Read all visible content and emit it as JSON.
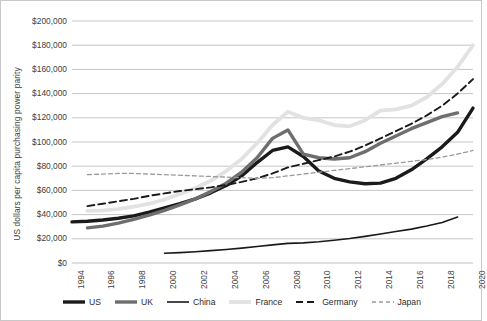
{
  "chart_data": {
    "type": "line",
    "title": "",
    "xlabel": "",
    "ylabel": "US dollars per capita purchasing power parity",
    "xlim": [
      1994,
      2020
    ],
    "ylim": [
      0,
      200000
    ],
    "grid": true,
    "legend_position": "bottom",
    "ytick_labels": [
      "$200,000",
      "$180,000",
      "$160,000",
      "$140,000",
      "$120,000",
      "$100,000",
      "$80,000",
      "$60,000",
      "$40,000",
      "$20,000",
      "$0"
    ],
    "ytick_values": [
      200000,
      180000,
      160000,
      140000,
      120000,
      100000,
      80000,
      60000,
      40000,
      20000,
      0
    ],
    "xtick_labels": [
      "1994",
      "1996",
      "1998",
      "2000",
      "2002",
      "2004",
      "2006",
      "2008",
      "2010",
      "2012",
      "2014",
      "2016",
      "2018",
      "2020"
    ],
    "xtick_values": [
      1994,
      1996,
      1998,
      2000,
      2002,
      2004,
      2006,
      2008,
      2010,
      2012,
      2014,
      2016,
      2018,
      2020
    ],
    "series": [
      {
        "name": "US",
        "color": "#1a1a1a",
        "width": 3.4,
        "dash": "none",
        "x": [
          1994,
          1995,
          1996,
          1997,
          1998,
          1999,
          2000,
          2001,
          2002,
          2003,
          2004,
          2005,
          2006,
          2007,
          2008,
          2009,
          2010,
          2011,
          2012,
          2013,
          2014,
          2015,
          2016,
          2017,
          2018,
          2019,
          2020
        ],
        "values": [
          34000,
          34500,
          35500,
          37000,
          39000,
          42000,
          45500,
          49000,
          53000,
          58000,
          64000,
          72000,
          83000,
          93000,
          96000,
          88000,
          76000,
          70000,
          67000,
          65500,
          66000,
          70000,
          77000,
          86000,
          96000,
          108000,
          128000
        ]
      },
      {
        "name": "UK",
        "color": "#6e6e6e",
        "width": 3.4,
        "dash": "none",
        "x": [
          1995,
          1996,
          1997,
          1998,
          1999,
          2000,
          2001,
          2002,
          2003,
          2004,
          2005,
          2006,
          2007,
          2008,
          2009,
          2010,
          2011,
          2012,
          2013,
          2014,
          2015,
          2016,
          2017,
          2018,
          2019
        ],
        "values": [
          29000,
          30500,
          33000,
          36000,
          39500,
          43500,
          48000,
          53000,
          59000,
          66000,
          75000,
          87000,
          103000,
          110000,
          90000,
          87000,
          86000,
          87000,
          92000,
          99000,
          105000,
          111000,
          116000,
          121000,
          124000
        ]
      },
      {
        "name": "China",
        "color": "#1a1a1a",
        "width": 1.6,
        "dash": "none",
        "x": [
          2000,
          2001,
          2002,
          2003,
          2004,
          2005,
          2006,
          2007,
          2008,
          2009,
          2010,
          2011,
          2012,
          2013,
          2014,
          2015,
          2016,
          2017,
          2018,
          2019
        ],
        "values": [
          8000,
          8600,
          9300,
          10200,
          11200,
          12300,
          13600,
          15000,
          16200,
          16600,
          17500,
          18800,
          20200,
          22000,
          24000,
          26000,
          28000,
          30500,
          33500,
          38000
        ]
      },
      {
        "name": "France",
        "color": "#e2e2e2",
        "width": 3.8,
        "dash": "none",
        "x": [
          1995,
          1996,
          1997,
          1998,
          1999,
          2000,
          2001,
          2002,
          2003,
          2004,
          2005,
          2006,
          2007,
          2008,
          2009,
          2010,
          2011,
          2012,
          2013,
          2014,
          2015,
          2016,
          2017,
          2018,
          2019,
          2020
        ],
        "values": [
          43000,
          43500,
          44500,
          46500,
          49000,
          52500,
          57000,
          62000,
          68000,
          76000,
          86000,
          99000,
          114000,
          125000,
          120000,
          118000,
          114000,
          113000,
          118000,
          126000,
          127000,
          130000,
          137000,
          148000,
          162000,
          180000
        ]
      },
      {
        "name": "Germany",
        "color": "#1a1a1a",
        "width": 1.9,
        "dash": "7,4",
        "x": [
          1995,
          1996,
          1997,
          1998,
          1999,
          2000,
          2001,
          2002,
          2003,
          2004,
          2005,
          2006,
          2007,
          2008,
          2009,
          2010,
          2011,
          2012,
          2013,
          2014,
          2015,
          2016,
          2017,
          2018,
          2019,
          2020
        ],
        "values": [
          47000,
          49000,
          51000,
          53000,
          55500,
          57500,
          59500,
          61000,
          62500,
          64500,
          67000,
          70000,
          74000,
          79000,
          82000,
          85000,
          88000,
          92000,
          97000,
          103000,
          109000,
          115000,
          122000,
          130000,
          140000,
          152000
        ]
      },
      {
        "name": "Japan",
        "color": "#9a9a9a",
        "width": 1.3,
        "dash": "4,3",
        "x": [
          1995,
          1996,
          1997,
          1998,
          1999,
          2000,
          2001,
          2002,
          2003,
          2004,
          2005,
          2006,
          2007,
          2008,
          2009,
          2010,
          2011,
          2012,
          2013,
          2014,
          2015,
          2016,
          2017,
          2018,
          2019,
          2020
        ],
        "values": [
          73000,
          73500,
          74000,
          74000,
          73500,
          73000,
          72500,
          72000,
          71500,
          71000,
          70500,
          70000,
          70500,
          72000,
          73500,
          75000,
          76500,
          78000,
          79500,
          81000,
          82500,
          84000,
          85500,
          87500,
          90000,
          93000
        ]
      }
    ]
  },
  "legend": {
    "items": [
      {
        "label": "US",
        "style": "thick-solid-black"
      },
      {
        "label": "UK",
        "style": "thick-solid-gray"
      },
      {
        "label": "China",
        "style": "thin-solid-black"
      },
      {
        "label": "France",
        "style": "thick-solid-lightgray"
      },
      {
        "label": "Germany",
        "style": "dashed-black"
      },
      {
        "label": "Japan",
        "style": "fine-dashed-gray"
      }
    ]
  },
  "colors": {
    "gridline": "#c0c0c0",
    "border": "#c8c8c8",
    "text": "#404040",
    "background": "#ffffff"
  }
}
